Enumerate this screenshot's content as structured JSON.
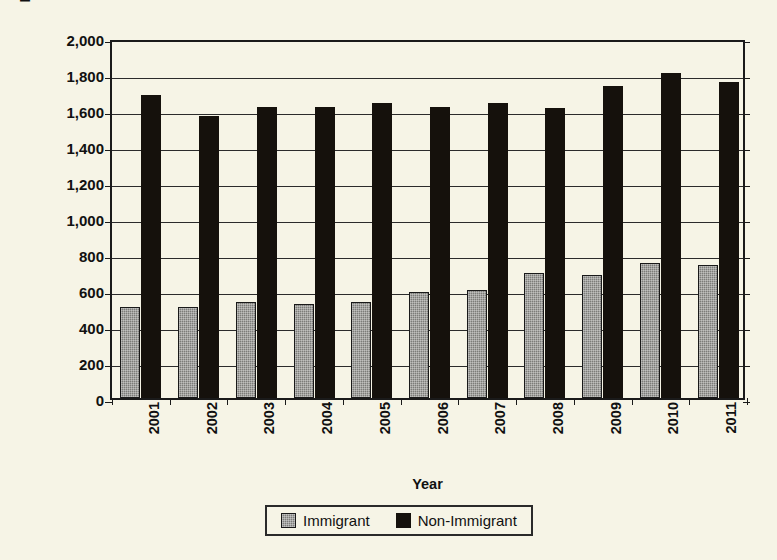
{
  "chart_data": {
    "type": "bar",
    "title": "",
    "xlabel": "Year",
    "ylabel": "Number of People (in thousands)",
    "categories": [
      "2001",
      "2002",
      "2003",
      "2004",
      "2005",
      "2006",
      "2007",
      "2008",
      "2009",
      "2010",
      "2011"
    ],
    "series": [
      {
        "name": "Immigrant",
        "color": "#7c7c79",
        "values": [
          505,
          505,
          535,
          525,
          535,
          590,
          600,
          695,
          685,
          750,
          740
        ]
      },
      {
        "name": "Non-Immigrant",
        "color": "#15110c",
        "values": [
          1685,
          1565,
          1615,
          1615,
          1640,
          1615,
          1640,
          1610,
          1735,
          1805,
          1755
        ]
      }
    ],
    "ylim": [
      0,
      2000
    ],
    "ytick_values": [
      0,
      200,
      400,
      600,
      800,
      1000,
      1200,
      1400,
      1600,
      1800,
      2000
    ],
    "ytick_labels": [
      "0",
      "200",
      "400",
      "600",
      "800",
      "1,000",
      "1,200",
      "1,400",
      "1,600",
      "1,800",
      "2,000"
    ],
    "grid": true,
    "legend_position": "bottom",
    "background_color": "#f6f4e6",
    "axis_color": "#1a1a1a"
  },
  "legend": {
    "items": [
      {
        "label": "Immigrant",
        "swatch": "immigrant"
      },
      {
        "label": "Non-Immigrant",
        "swatch": "nonimmigrant"
      }
    ]
  }
}
